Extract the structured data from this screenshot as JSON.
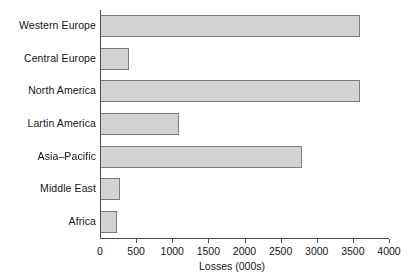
{
  "chart_data": {
    "type": "bar",
    "orientation": "horizontal",
    "title": "",
    "xlabel": "Losses (000s)",
    "ylabel": "",
    "categories": [
      "Western Europe",
      "Central Europe",
      "North America",
      "Lartin America",
      "Asia–Pacific",
      "Middle East",
      "Africa"
    ],
    "values": [
      3600,
      400,
      3600,
      1100,
      2800,
      280,
      230
    ],
    "xlim": [
      0,
      4000
    ],
    "xticks": [
      0,
      500,
      1000,
      1500,
      2000,
      2500,
      3000,
      3500,
      4000
    ],
    "xtick_labels": [
      "0",
      "500",
      "1000",
      "1500",
      "2000",
      "2500",
      "3000",
      "3500",
      "4000"
    ],
    "grid": false,
    "legend": null,
    "bar_fill_color": "#d2d2d2",
    "bar_border_color": "#7c7c7c",
    "axis_color": "#4d4d4d",
    "background_color": "#ffffff"
  }
}
